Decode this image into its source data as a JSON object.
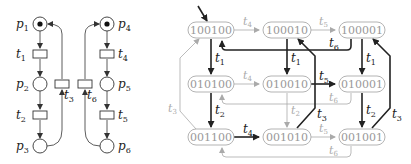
{
  "petri_net": {
    "places": [
      {
        "id": "p1",
        "label": "p",
        "sub": "1",
        "token": true
      },
      {
        "id": "p2",
        "label": "p",
        "sub": "2",
        "token": false
      },
      {
        "id": "p3",
        "label": "p",
        "sub": "3",
        "token": false
      },
      {
        "id": "p4",
        "label": "p",
        "sub": "4",
        "token": true
      },
      {
        "id": "p5",
        "label": "p",
        "sub": "5",
        "token": false
      },
      {
        "id": "p6",
        "label": "p",
        "sub": "6",
        "token": false
      }
    ],
    "transitions": [
      {
        "id": "t1",
        "label": "t",
        "sub": "1"
      },
      {
        "id": "t2",
        "label": "t",
        "sub": "2"
      },
      {
        "id": "t3",
        "label": "t",
        "sub": "3"
      },
      {
        "id": "t4",
        "label": "t",
        "sub": "4"
      },
      {
        "id": "t5",
        "label": "t",
        "sub": "5"
      },
      {
        "id": "t6",
        "label": "t",
        "sub": "6"
      }
    ]
  },
  "reachability_graph": {
    "states": [
      {
        "id": "s100100",
        "label": "100100",
        "initial": true
      },
      {
        "id": "s100010",
        "label": "100010"
      },
      {
        "id": "s100001",
        "label": "100001"
      },
      {
        "id": "s010100",
        "label": "010100"
      },
      {
        "id": "s010010",
        "label": "010010"
      },
      {
        "id": "s010001",
        "label": "010001"
      },
      {
        "id": "s001100",
        "label": "001100"
      },
      {
        "id": "s001010",
        "label": "001010"
      },
      {
        "id": "s001001",
        "label": "001001"
      }
    ],
    "edges": [
      {
        "from": "100100",
        "to": "100010",
        "label": "t",
        "sub": "4",
        "bold": false
      },
      {
        "from": "100010",
        "to": "100001",
        "label": "t",
        "sub": "5",
        "bold": false
      },
      {
        "from": "100001",
        "to": "100100",
        "label": "t",
        "sub": "6",
        "bold": true
      },
      {
        "from": "100100",
        "to": "010100",
        "label": "t",
        "sub": "1",
        "bold": true
      },
      {
        "from": "100010",
        "to": "010010",
        "label": "t",
        "sub": "1",
        "bold": true
      },
      {
        "from": "100001",
        "to": "010001",
        "label": "t",
        "sub": "1",
        "bold": true
      },
      {
        "from": "010100",
        "to": "010010",
        "label": "t",
        "sub": "4",
        "bold": false
      },
      {
        "from": "010010",
        "to": "010001",
        "label": "t",
        "sub": "5",
        "bold": true
      },
      {
        "from": "010001",
        "to": "010100",
        "label": "t",
        "sub": "6",
        "bold": false
      },
      {
        "from": "010100",
        "to": "001100",
        "label": "t",
        "sub": "2",
        "bold": true
      },
      {
        "from": "010010",
        "to": "001010",
        "label": "t",
        "sub": "2",
        "bold": false
      },
      {
        "from": "010001",
        "to": "001001",
        "label": "t",
        "sub": "2",
        "bold": true
      },
      {
        "from": "001100",
        "to": "001010",
        "label": "t",
        "sub": "4",
        "bold": true
      },
      {
        "from": "001010",
        "to": "001001",
        "label": "t",
        "sub": "5",
        "bold": false
      },
      {
        "from": "001001",
        "to": "001100",
        "label": "t",
        "sub": "6",
        "bold": false
      },
      {
        "from": "001100",
        "to": "100100",
        "label": "t",
        "sub": "3",
        "bold": false
      },
      {
        "from": "001010",
        "to": "100010",
        "label": "t",
        "sub": "3",
        "bold": true
      },
      {
        "from": "001001",
        "to": "100001",
        "label": "t",
        "sub": "3",
        "bold": true
      }
    ]
  }
}
